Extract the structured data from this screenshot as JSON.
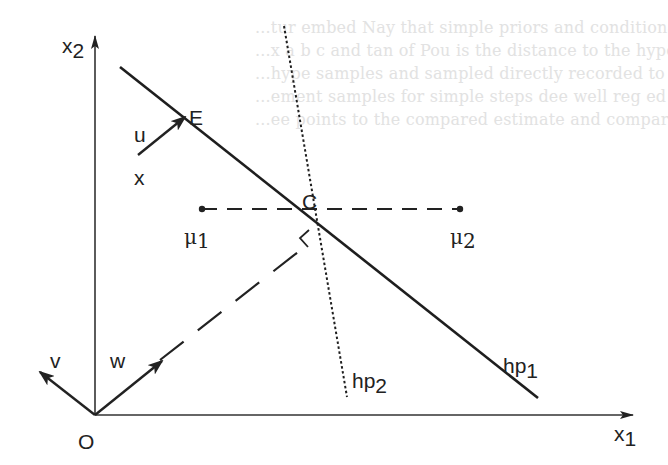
{
  "figure": {
    "background_text": [
      "...tur embed Nay that simple priors and conditionals ...",
      "...x a b c and tan of Pou is the distance to the hyperplane ...",
      "...hype samples and sampled directly recorded to the hyperplane ...",
      "...ement samples for simple steps dee well reg ed rules ...",
      "...ee points to the compared estimate and compare. variable ..."
    ],
    "axes": {
      "x1": {
        "label": "x",
        "subscript": "1"
      },
      "x2": {
        "label": "x",
        "subscript": "2"
      },
      "origin": "O"
    },
    "points": {
      "E": "E",
      "C": "C",
      "x": "x",
      "mu1": {
        "label": "μ",
        "subscript": "1"
      },
      "mu2": {
        "label": "μ",
        "subscript": "2"
      }
    },
    "vectors": {
      "u": "u",
      "v": "v",
      "w": "w"
    },
    "hyperplanes": {
      "hp1": {
        "label": "hp",
        "subscript": "1",
        "style": "solid"
      },
      "hp2": {
        "label": "hp",
        "subscript": "2",
        "style": "dotted"
      }
    },
    "colors": {
      "ink": "#222222",
      "bleed": "#e2e2e2",
      "background": "#ffffff"
    }
  }
}
